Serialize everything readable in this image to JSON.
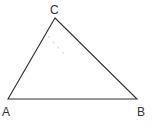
{
  "diagram": {
    "type": "triangle",
    "vertices": [
      {
        "label": "A",
        "x": 8,
        "y": 99
      },
      {
        "label": "B",
        "x": 137,
        "y": 99
      },
      {
        "label": "C",
        "x": 55,
        "y": 18
      }
    ],
    "labels": {
      "A": "A",
      "B": "B",
      "C": "C"
    },
    "dashed_segment": {
      "x1": 48,
      "y1": 36,
      "x2": 64,
      "y2": 54
    },
    "colors": {
      "line": "#333333",
      "dashed": "#d0d0d0",
      "background": "#ffffff"
    }
  }
}
